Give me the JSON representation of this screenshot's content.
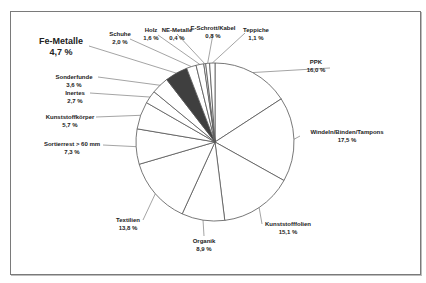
{
  "chart_data": {
    "type": "pie",
    "title": "",
    "start_angle_deg": 0,
    "direction": "clockwise",
    "highlight": "Fe-Metalle",
    "colors": {
      "fill": "#ffffff",
      "highlight_fill": "#3f3f3f",
      "stroke": "#555555"
    },
    "slices": [
      {
        "label": "PPK",
        "value": 16.0,
        "text": "16,0 %"
      },
      {
        "label": "Windeln/Binden/Tampons",
        "value": 17.5,
        "text": "17,5 %"
      },
      {
        "label": "Kunststofffolien",
        "value": 15.1,
        "text": "15,1 %"
      },
      {
        "label": "Organik",
        "value": 8.9,
        "text": "8,9 %"
      },
      {
        "label": "Textilien",
        "value": 13.8,
        "text": "13,8 %"
      },
      {
        "label": "Sortierrest > 60 mm",
        "value": 7.3,
        "text": "7,3 %"
      },
      {
        "label": "Kunststoffkörper",
        "value": 5.7,
        "text": "5,7 %"
      },
      {
        "label": "Inertes",
        "value": 2.7,
        "text": "2,7 %"
      },
      {
        "label": "Sonderfunde",
        "value": 3.6,
        "text": "3,6 %"
      },
      {
        "label": "Fe-Metalle",
        "value": 4.7,
        "text": "4,7 %"
      },
      {
        "label": "Schuhe",
        "value": 2.0,
        "text": "2,0 %"
      },
      {
        "label": "Holz",
        "value": 1.6,
        "text": "1,6 %"
      },
      {
        "label": "NE-Metalle",
        "value": 0.4,
        "text": "0,4 %"
      },
      {
        "label": "E-Schrott/Kabel",
        "value": 0.8,
        "text": "0,8 %"
      },
      {
        "label": "Teppiche",
        "value": 1.1,
        "text": "1,1 %"
      }
    ]
  },
  "labels": [
    {
      "name": "PPK",
      "pct": "16,0 %",
      "x": 316,
      "y": 58,
      "lx": 330,
      "ly": 68
    },
    {
      "name": "Windeln/Binden/Tampons",
      "pct": "17,5 %",
      "x": 347,
      "y": 128,
      "lx": 300,
      "ly": 136
    },
    {
      "name": "Kunststofffolien",
      "pct": "15,1 %",
      "x": 288,
      "y": 220,
      "lx": 262,
      "ly": 224
    },
    {
      "name": "Organik",
      "pct": "8,9 %",
      "x": 204,
      "y": 237,
      "lx": 204,
      "ly": 236
    },
    {
      "name": "Textilien",
      "pct": "13,8 %",
      "x": 128,
      "y": 216,
      "lx": 143,
      "ly": 220
    },
    {
      "name": "Sortierrest > 60 mm",
      "pct": "7,3 %",
      "x": 72,
      "y": 140,
      "lx": 103,
      "ly": 145
    },
    {
      "name": "Kunststoffkörper",
      "pct": "5,7 %",
      "x": 70,
      "y": 113,
      "lx": 96,
      "ly": 117
    },
    {
      "name": "Inertes",
      "pct": "2,7 %",
      "x": 75,
      "y": 89,
      "lx": 90,
      "ly": 93
    },
    {
      "name": "Sonderfunde",
      "pct": "3,6 %",
      "x": 74,
      "y": 73,
      "lx": 98,
      "ly": 77
    },
    {
      "name": "Fe-Metalle",
      "pct": "4,7 %",
      "x": 61,
      "y": 36,
      "lx": 89,
      "ly": 46,
      "big": true
    },
    {
      "name": "Schuhe",
      "pct": "2,0 %",
      "x": 120,
      "y": 30,
      "lx": 130,
      "ly": 39
    },
    {
      "name": "Holz",
      "pct": "1,6 %",
      "x": 151,
      "y": 26,
      "lx": 158,
      "ly": 35
    },
    {
      "name": "NE-Metalle",
      "pct": "0,4 %",
      "x": 177,
      "y": 26,
      "lx": 177,
      "ly": 34
    },
    {
      "name": "E-Schrott/Kabel",
      "pct": "0,8 %",
      "x": 213,
      "y": 24,
      "lx": 213,
      "ly": 34
    },
    {
      "name": "Teppiche",
      "pct": "1,1 %",
      "x": 256,
      "y": 26,
      "lx": 245,
      "ly": 33
    }
  ]
}
